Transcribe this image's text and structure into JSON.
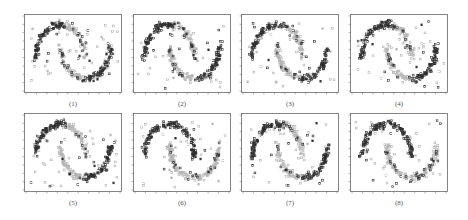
{
  "figure": {
    "background": "#ffffff",
    "frame_color": "#666666",
    "dark_color": "#2e2e2e",
    "light_color": "#b4b4b4"
  },
  "chart_data": [
    {
      "type": "scatter",
      "caption": "(1)",
      "title": "",
      "xlabel": "",
      "ylabel": "",
      "grid": false,
      "legend": null,
      "series": [
        {
          "name": "dark cluster (upper-left arc + lower-right arc tips)",
          "color": "#2e2e2e"
        },
        {
          "name": "light cluster (central/inner arcs)",
          "color": "#b4b4b4"
        }
      ],
      "layout": {
        "dataset": "two-moons",
        "dark_assignment": "split",
        "seed": 11
      }
    },
    {
      "type": "scatter",
      "caption": "(2)",
      "title": "",
      "xlabel": "",
      "ylabel": "",
      "grid": false,
      "legend": null,
      "series": [
        {
          "name": "dark cluster",
          "color": "#2e2e2e"
        },
        {
          "name": "light cluster",
          "color": "#b4b4b4"
        }
      ],
      "layout": {
        "dataset": "two-moons",
        "dark_assignment": "split",
        "seed": 23
      }
    },
    {
      "type": "scatter",
      "caption": "(3)",
      "title": "",
      "xlabel": "",
      "ylabel": "",
      "grid": false,
      "legend": null,
      "series": [
        {
          "name": "dark cluster",
          "color": "#2e2e2e"
        },
        {
          "name": "light cluster",
          "color": "#b4b4b4"
        }
      ],
      "layout": {
        "dataset": "two-moons",
        "dark_assignment": "split",
        "seed": 37
      }
    },
    {
      "type": "scatter",
      "caption": "(4)",
      "title": "",
      "xlabel": "",
      "ylabel": "",
      "grid": false,
      "legend": null,
      "series": [
        {
          "name": "dark cluster",
          "color": "#2e2e2e"
        },
        {
          "name": "light cluster",
          "color": "#b4b4b4"
        }
      ],
      "layout": {
        "dataset": "two-moons",
        "dark_assignment": "split",
        "seed": 41
      }
    },
    {
      "type": "scatter",
      "caption": "(5)",
      "title": "",
      "xlabel": "",
      "ylabel": "",
      "grid": false,
      "legend": null,
      "series": [
        {
          "name": "dark cluster",
          "color": "#2e2e2e"
        },
        {
          "name": "light cluster",
          "color": "#b4b4b4"
        }
      ],
      "layout": {
        "dataset": "two-moons",
        "dark_assignment": "split",
        "seed": 53
      }
    },
    {
      "type": "scatter",
      "caption": "(6)",
      "title": "",
      "xlabel": "",
      "ylabel": "",
      "grid": false,
      "legend": null,
      "series": [
        {
          "name": "dark cluster (upper moon)",
          "color": "#2e2e2e"
        },
        {
          "name": "light cluster (lower moon)",
          "color": "#b4b4b4"
        }
      ],
      "layout": {
        "dataset": "two-moons",
        "dark_assignment": "upper",
        "seed": 67
      }
    },
    {
      "type": "scatter",
      "caption": "(7)",
      "title": "",
      "xlabel": "",
      "ylabel": "",
      "grid": false,
      "legend": null,
      "series": [
        {
          "name": "dark cluster",
          "color": "#2e2e2e"
        },
        {
          "name": "light cluster",
          "color": "#b4b4b4"
        }
      ],
      "layout": {
        "dataset": "two-moons",
        "dark_assignment": "split",
        "seed": 71
      }
    },
    {
      "type": "scatter",
      "caption": "(8)",
      "title": "",
      "xlabel": "",
      "ylabel": "",
      "grid": false,
      "legend": null,
      "series": [
        {
          "name": "dark cluster (upper moon)",
          "color": "#2e2e2e"
        },
        {
          "name": "light cluster (lower moon)",
          "color": "#b4b4b4"
        }
      ],
      "layout": {
        "dataset": "two-moons",
        "dark_assignment": "upper",
        "seed": 89
      }
    }
  ]
}
